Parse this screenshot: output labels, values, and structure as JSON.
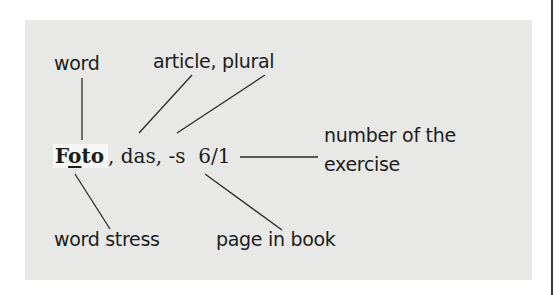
{
  "diagram": {
    "entry": {
      "headword_prefix": "F",
      "headword_stressed": "o",
      "headword_suffix": "to",
      "rest": ", das, -s  6/1"
    },
    "labels": {
      "word": "word",
      "article_plural": "article,  plural",
      "number_line1": "number of the",
      "number_line2": "exercise",
      "word_stress": "word stress",
      "page_in_book": "page in book"
    },
    "colors": {
      "panel_background": "#e8e8e6",
      "text": "#1c1c1c",
      "lines": "#2a2a2a"
    }
  }
}
